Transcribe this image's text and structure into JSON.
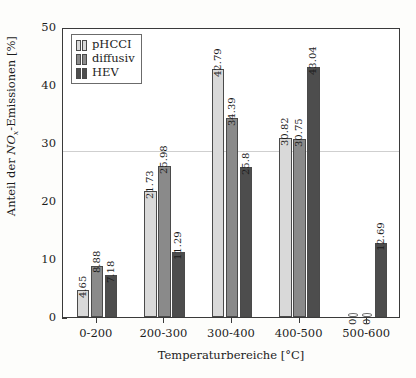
{
  "chart_data": {
    "type": "bar",
    "title": "",
    "subtitle": "",
    "xlabel": "Temperaturbereiche [°C]",
    "ylabel": "Anteil der NOx-Emissionen [%]",
    "ylabel_parts": {
      "prefix": "Anteil der ",
      "italic": "NO",
      "subscript": "x",
      "suffix": "-Emissionen [%]"
    },
    "categories": [
      "0-200",
      "200-300",
      "300-400",
      "400-500",
      "500-600"
    ],
    "series": [
      {
        "name": "pHCCI",
        "color": "#d9d9d9",
        "values": [
          4.65,
          21.73,
          42.79,
          30.82,
          0
        ],
        "labels": [
          "4.65",
          "21.73",
          "42.79",
          "30.82",
          "0"
        ]
      },
      {
        "name": "diffusiv",
        "color": "#8a8a8a",
        "values": [
          8.88,
          25.98,
          34.39,
          30.75,
          0
        ],
        "labels": [
          "8.88",
          "25.98",
          "34.39",
          "30.75",
          "0"
        ]
      },
      {
        "name": "HEV",
        "color": "#4d4d4d",
        "values": [
          7.18,
          11.29,
          25.8,
          43.04,
          12.69
        ],
        "labels": [
          "7.18",
          "11.29",
          "25.8",
          "43.04",
          "12.69"
        ]
      }
    ],
    "ylim": [
      0,
      50
    ],
    "yticks": [
      0,
      10,
      20,
      30,
      40,
      50
    ],
    "ytick_labels": [
      "0",
      "10",
      "20",
      "30",
      "40",
      "50"
    ],
    "grid": false,
    "legend_position": "upper left",
    "legend_entries": [
      "pHCCI",
      "diffusiv",
      "HEV"
    ]
  }
}
